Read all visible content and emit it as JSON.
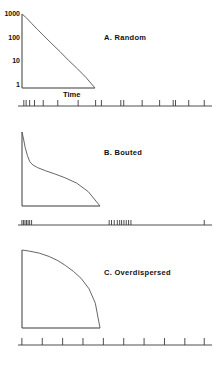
{
  "figure": {
    "background": "#ffffff",
    "line_color": "#3a3a3a",
    "text_color": "#111111",
    "xlabel": "Time"
  },
  "chart_data": [
    {
      "type": "line",
      "title": "A.   Random",
      "panel": "A",
      "xlabel": "Time",
      "ylabel": "",
      "yticks": [
        "1000",
        "100",
        "10",
        "1"
      ],
      "ytick_values": [
        1000,
        100,
        10,
        1
      ],
      "yscale": "log",
      "ylim": [
        1,
        1000
      ],
      "xlim": [
        0,
        1
      ],
      "grid": false,
      "legend": "none",
      "annotation": "log survivor plot, approximately straight negative slope (random / Poisson events)",
      "x": [
        0.0,
        0.06,
        0.13,
        0.21,
        0.3,
        0.4,
        0.52,
        0.64,
        0.76,
        0.88,
        1.0
      ],
      "y": [
        1000,
        700,
        420,
        240,
        130,
        66,
        30,
        13,
        6.0,
        2.6,
        1.0
      ],
      "raster": {
        "label": "event raster (random spacing)",
        "events": [
          0.03,
          0.042,
          0.06,
          0.085,
          0.13,
          0.205,
          0.31,
          0.4,
          0.43,
          0.53,
          0.545,
          0.64,
          0.73,
          0.8,
          0.812,
          0.88,
          0.96
        ]
      }
    },
    {
      "type": "line",
      "title": "B.   Bouted",
      "panel": "B",
      "xlabel": "",
      "ylabel": "",
      "yticks": [],
      "yscale": "log",
      "ylim": [
        1,
        1000
      ],
      "xlim": [
        0,
        1
      ],
      "grid": false,
      "legend": "none",
      "annotation": "broken-stick log survivor plot: steep within-bout limb then shallow between-bout limb",
      "x": [
        0.0,
        0.02,
        0.04,
        0.07,
        0.1,
        0.14,
        0.2,
        0.3,
        0.42,
        0.55,
        0.7,
        0.85,
        1.0
      ],
      "y": [
        1000,
        520,
        240,
        110,
        62,
        46,
        36,
        27,
        20,
        14,
        8.5,
        3.8,
        1.0
      ],
      "raster": {
        "label": "event raster (clustered bouts)",
        "events": [
          0.02,
          0.028,
          0.036,
          0.044,
          0.052,
          0.06,
          0.07,
          0.47,
          0.482,
          0.496,
          0.512,
          0.524,
          0.534,
          0.546,
          0.558,
          0.57,
          0.582,
          0.96
        ]
      }
    },
    {
      "type": "line",
      "title": "C.   Overdispersed",
      "panel": "C",
      "xlabel": "",
      "ylabel": "",
      "yticks": [],
      "yscale": "log",
      "ylim": [
        1,
        1000
      ],
      "xlim": [
        0,
        1
      ],
      "grid": false,
      "legend": "none",
      "annotation": "concave log survivor plot: shallow shoulder then steep fall (regular / overdispersed events)",
      "x": [
        0.0,
        0.1,
        0.22,
        0.35,
        0.46,
        0.56,
        0.66,
        0.76,
        0.86,
        0.94,
        1.0
      ],
      "y": [
        1000,
        900,
        760,
        560,
        390,
        250,
        150,
        80,
        32,
        9,
        1.0
      ],
      "raster": {
        "label": "event raster (regular spacing)",
        "events": [
          0.02,
          0.125,
          0.23,
          0.335,
          0.44,
          0.545,
          0.65,
          0.755,
          0.86,
          0.96
        ]
      }
    }
  ]
}
